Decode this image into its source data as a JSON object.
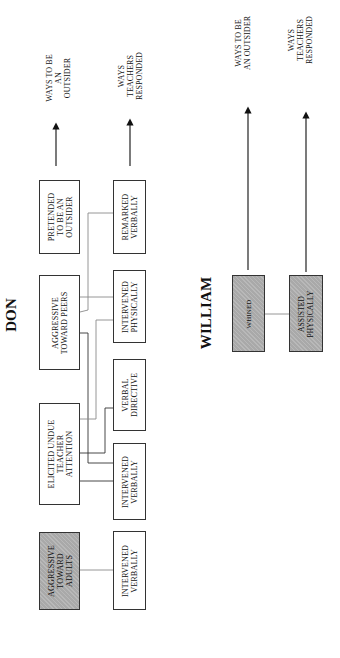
{
  "don": {
    "title": "DON",
    "legend": {
      "outsider": [
        "WAYS TO BE",
        "AN",
        "OUTSIDER"
      ],
      "teachers": [
        "WAYS",
        "TEACHERS",
        "RESPONDED"
      ]
    },
    "outsider_boxes": [
      {
        "lines": [
          "PRETENDED",
          "TO BE AN",
          "OUTSIDER"
        ],
        "shaded": false
      },
      {
        "lines": [
          "AGGRESSIVE",
          "TOWARD PEERS"
        ],
        "shaded": false
      },
      {
        "lines": [
          "ELICITED UNDUE",
          "TEACHER",
          "ATTENTION"
        ],
        "shaded": false
      },
      {
        "lines": [
          "AGGRESSIVE",
          "TOWARD",
          "ADULTS"
        ],
        "shaded": true
      }
    ],
    "response_boxes": [
      {
        "lines": [
          "REMARKED",
          "VERBALLY"
        ]
      },
      {
        "lines": [
          "INTERVENED",
          "PHYSICALLY"
        ]
      },
      {
        "lines": [
          "VERBAL",
          "DIRECTIVE"
        ]
      },
      {
        "lines": [
          "INTERVENED",
          "VERBALLY"
        ]
      },
      {
        "lines": [
          "INTERVENED",
          "VERBALLY"
        ]
      }
    ]
  },
  "william": {
    "title": "WILLIAM",
    "legend": {
      "outsider": [
        "WAYS TO BE",
        "AN OUTSIDER"
      ],
      "teachers": [
        "WAYS",
        "TEACHERS",
        "RESPONDED"
      ]
    },
    "outsider_boxes": [
      {
        "lines": [
          "WHINED"
        ],
        "shaded": true
      }
    ],
    "response_boxes": [
      {
        "lines": [
          "ASSISTED",
          "PHYSICALLY"
        ],
        "shaded": true
      }
    ]
  },
  "colors": {
    "box_border": "#333333",
    "shaded_fill": "#a9a9a9",
    "dark_line": "#333333",
    "gray_line": "#8a8a8a"
  }
}
